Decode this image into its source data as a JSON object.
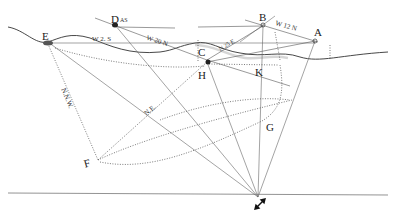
{
  "diagram": {
    "title": "",
    "points": {
      "A": {
        "label": "A",
        "x": 315,
        "y": 41
      },
      "B": {
        "label": "B",
        "x": 263,
        "y": 26
      },
      "C": {
        "label": "C",
        "x": 207,
        "y": 60
      },
      "D": {
        "label": "D",
        "x": 115,
        "y": 25,
        "superscript": "AS"
      },
      "E": {
        "label": "E",
        "x": 48,
        "y": 42
      },
      "F": {
        "label": "F",
        "x": 98,
        "y": 160
      },
      "G": {
        "label": "G",
        "x": 262,
        "y": 121
      },
      "H": {
        "label": "H",
        "x": 209,
        "y": 64
      },
      "K": {
        "label": "K",
        "x": 263,
        "y": 65
      },
      "P": {
        "label": "",
        "x": 258,
        "y": 197
      }
    },
    "bearings": {
      "e_w": "W 2. S",
      "d_c": "W 20 N",
      "c_b": "N 25 E",
      "b_a": "W 12 N",
      "f_e": "N.N.W.",
      "f_c": "N.E."
    },
    "north_arrow": "north-south-arrow"
  }
}
